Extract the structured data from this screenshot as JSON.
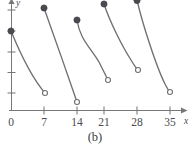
{
  "chart_data": {
    "type": "line",
    "title": "",
    "subtitle": "",
    "caption": "(b)",
    "xlabel": "x",
    "ylabel": "y",
    "grid": false,
    "legend": null,
    "xlim": [
      -1.5,
      39
    ],
    "ylim": [
      0,
      5.5
    ],
    "x_ticks": [
      0,
      7,
      14,
      21,
      28,
      35
    ],
    "x_tick_labels": [
      "0",
      "7",
      "14",
      "21",
      "28",
      "35"
    ],
    "y_ticks": [
      1,
      2,
      3,
      4,
      5
    ],
    "y_tick_labels": [
      "",
      "",
      "",
      "",
      ""
    ],
    "period": 7,
    "series": [
      {
        "name": "segment-1",
        "closed_endpoint": {
          "x": 0,
          "y": 3.2
        },
        "open_endpoint": {
          "x": 7,
          "y": 0.85
        },
        "path": "M 11,31 C 18,48 32,78 45,93"
      },
      {
        "name": "segment-2",
        "closed_endpoint": {
          "x": 7,
          "y": 4.9
        },
        "open_endpoint": {
          "x": 14,
          "y": 0.4
        },
        "path": "M 44,8 C 52,30 68,76 77,102"
      },
      {
        "name": "segment-3",
        "closed_endpoint": {
          "x": 14,
          "y": 4.35
        },
        "open_endpoint": {
          "x": 21,
          "y": 1.55
        },
        "path": "M 77,20 C 80,40 91,48 99,62 C 103,70 106,76 108,80"
      },
      {
        "name": "segment-4",
        "closed_endpoint": {
          "x": 21,
          "y": 5.1
        },
        "open_endpoint": {
          "x": 28,
          "y": 2.0
        },
        "path": "M 104,4 C 110,22 122,46 131,60 C 134,65 136,68 138,70"
      },
      {
        "name": "segment-5",
        "closed_endpoint": {
          "x": 28,
          "y": 5.5
        },
        "open_endpoint": {
          "x": 35,
          "y": 1.0
        },
        "path": "M 137,0 C 142,22 156,66 165,84 C 167,88 169,91 170,92"
      }
    ],
    "markers": {
      "closed": "filled-circle",
      "open": "hollow-circle"
    },
    "colors": {
      "curve": "#6f6f74",
      "axis": "#77777b",
      "closed_marker": "#4a4a50",
      "open_marker_fill": "#ffffff",
      "text": "#3c3c42",
      "background": "#ffffff"
    }
  }
}
